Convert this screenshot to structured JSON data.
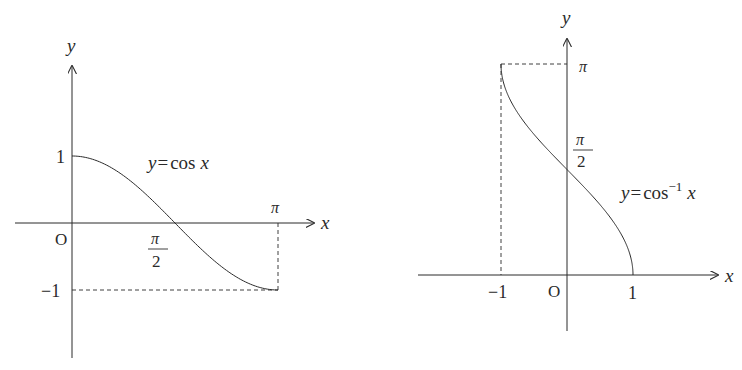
{
  "left_graph": {
    "function_label": {
      "y": "y",
      "eq": "=",
      "rest": "cos",
      "x": "x"
    },
    "axis_labels": {
      "x": "x",
      "y": "y",
      "origin": "O"
    },
    "ticks": {
      "y_top": "1",
      "y_bottom": "−1",
      "x_mid_num": "π",
      "x_mid_den": "2",
      "x_end": "π"
    }
  },
  "right_graph": {
    "function_label": {
      "y": "y",
      "eq": "=",
      "rest": "cos",
      "sup": "−1",
      "x": "x"
    },
    "axis_labels": {
      "x": "x",
      "y": "y",
      "origin": "O"
    },
    "ticks": {
      "x_left": "−1",
      "x_right": "1",
      "y_mid_num": "π",
      "y_mid_den": "2",
      "y_top": "π"
    }
  },
  "chart_data": [
    {
      "type": "line",
      "title": "y = cos x",
      "xlabel": "x",
      "ylabel": "y",
      "x": [
        0,
        0.3927,
        0.7854,
        1.1781,
        1.5708,
        1.9635,
        2.3562,
        2.7489,
        3.1416
      ],
      "series": [
        {
          "name": "y = cos x",
          "values": [
            1,
            0.924,
            0.707,
            0.383,
            0,
            -0.383,
            -0.707,
            -0.924,
            -1
          ]
        }
      ],
      "xticks": [
        "π/2",
        "π"
      ],
      "yticks": [
        "1",
        "−1"
      ],
      "xlim": [
        0,
        3.1416
      ],
      "ylim": [
        -1,
        1
      ],
      "grid": false
    },
    {
      "type": "line",
      "title": "y = cos⁻¹ x",
      "xlabel": "x",
      "ylabel": "y",
      "x": [
        -1,
        -0.75,
        -0.5,
        -0.25,
        0,
        0.25,
        0.5,
        0.75,
        1
      ],
      "series": [
        {
          "name": "y = cos⁻¹ x",
          "values": [
            3.1416,
            2.4189,
            2.0944,
            1.8235,
            1.5708,
            1.3181,
            1.0472,
            0.7227,
            0
          ]
        }
      ],
      "xticks": [
        "−1",
        "1"
      ],
      "yticks": [
        "π/2",
        "π"
      ],
      "xlim": [
        -1,
        1
      ],
      "ylim": [
        0,
        3.1416
      ],
      "grid": false
    }
  ]
}
